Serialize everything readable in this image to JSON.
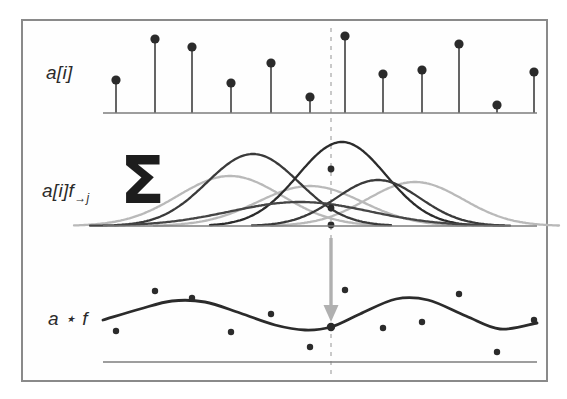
{
  "figure": {
    "background": "#ffffff",
    "frame": {
      "stroke": "#8a8a8a",
      "x": 21,
      "y": 19,
      "width": 527,
      "height": 363
    }
  },
  "colors": {
    "dark": "#2b2b2b",
    "mid": "#4a4a4a",
    "light_gray": "#b9b9b9",
    "axis": "#7d7d7d",
    "dashed": "#c9c9c9",
    "arrow": "#b0b0b0",
    "frame": "#8a8a8a"
  },
  "labels": {
    "top_panel": "a[i]",
    "middle_panel_main": "a[i]f",
    "middle_panel_sub": "→j",
    "bottom_panel": "a ⋆ f",
    "sigma": "Σ"
  },
  "marker_line": {
    "name": "alignment-dashed-line",
    "x": 331,
    "y_top": 28,
    "y_bottom": 375,
    "dash": "4 5"
  },
  "arrow": {
    "name": "down-arrow",
    "x": 331,
    "y_start": 238,
    "y_end": 322,
    "color": "#b0b0b0"
  },
  "chart_data": {
    "type": "line",
    "xlabel": "",
    "ylabel": "",
    "panels": [
      {
        "id": "input-signal",
        "label": "a[i]",
        "type": "stem",
        "baseline_y": 113,
        "x_start": 103,
        "x_end": 537,
        "stems": [
          {
            "x": 116,
            "y": 80,
            "value": 0.45
          },
          {
            "x": 155,
            "y": 39,
            "value": 0.92
          },
          {
            "x": 192,
            "y": 47,
            "value": 0.84
          },
          {
            "x": 231,
            "y": 83,
            "value": 0.41
          },
          {
            "x": 271,
            "y": 63,
            "value": 0.63
          },
          {
            "x": 310,
            "y": 97,
            "value": 0.26
          },
          {
            "x": 345,
            "y": 36,
            "value": 0.95
          },
          {
            "x": 383,
            "y": 74,
            "value": 0.52
          },
          {
            "x": 422,
            "y": 70,
            "value": 0.57
          },
          {
            "x": 459,
            "y": 44,
            "value": 0.87
          },
          {
            "x": 497,
            "y": 105,
            "value": 0.16
          },
          {
            "x": 534,
            "y": 72,
            "value": 0.54
          }
        ]
      },
      {
        "id": "shifted-filter-responses",
        "label": "a[i]f→j",
        "type": "gaussians",
        "baseline_y": 226,
        "x_start": 103,
        "x_end": 537,
        "curves": [
          {
            "center": 230,
            "height": 50,
            "width": 52,
            "shade": "#b9b9b9",
            "name": "gaussian-light-1"
          },
          {
            "center": 310,
            "height": 40,
            "width": 52,
            "shade": "#b9b9b9",
            "name": "gaussian-light-2"
          },
          {
            "center": 415,
            "height": 44,
            "width": 48,
            "shade": "#b9b9b9",
            "name": "gaussian-light-3"
          },
          {
            "center": 253,
            "height": 72,
            "width": 46,
            "shade": "#3a3a3a",
            "name": "gaussian-dark-1"
          },
          {
            "center": 342,
            "height": 84,
            "width": 44,
            "shade": "#2b2b2b",
            "name": "gaussian-dark-2"
          },
          {
            "center": 378,
            "height": 46,
            "width": 42,
            "shade": "#3a3a3a",
            "name": "gaussian-dark-3"
          },
          {
            "center": 300,
            "height": 24,
            "width": 70,
            "shade": "#454545",
            "name": "gaussian-dark-4"
          }
        ],
        "intersection_dots": [
          {
            "x": 331,
            "y": 169,
            "name": "peak-contribution-dot"
          },
          {
            "x": 331,
            "y": 208,
            "name": "mid-contribution-dot"
          },
          {
            "x": 331,
            "y": 225,
            "name": "base-contribution-dot"
          }
        ]
      },
      {
        "id": "convolution-output",
        "label": "a ⋆ f",
        "type": "curve-with-points",
        "baseline_y": 362,
        "x_start": 103,
        "x_end": 537,
        "curve_points": [
          {
            "x": 103,
            "y": 320
          },
          {
            "x": 140,
            "y": 309
          },
          {
            "x": 172,
            "y": 301
          },
          {
            "x": 205,
            "y": 302
          },
          {
            "x": 240,
            "y": 313
          },
          {
            "x": 275,
            "y": 325
          },
          {
            "x": 305,
            "y": 330
          },
          {
            "x": 331,
            "y": 327
          },
          {
            "x": 360,
            "y": 314
          },
          {
            "x": 396,
            "y": 299
          },
          {
            "x": 428,
            "y": 300
          },
          {
            "x": 466,
            "y": 316
          },
          {
            "x": 500,
            "y": 329
          },
          {
            "x": 537,
            "y": 323
          }
        ],
        "scatter_points": [
          {
            "x": 116,
            "y": 331
          },
          {
            "x": 155,
            "y": 291
          },
          {
            "x": 192,
            "y": 298
          },
          {
            "x": 231,
            "y": 332
          },
          {
            "x": 271,
            "y": 314
          },
          {
            "x": 310,
            "y": 347
          },
          {
            "x": 331,
            "y": 327,
            "highlight": true
          },
          {
            "x": 345,
            "y": 290
          },
          {
            "x": 383,
            "y": 328
          },
          {
            "x": 422,
            "y": 322
          },
          {
            "x": 459,
            "y": 294
          },
          {
            "x": 497,
            "y": 352
          },
          {
            "x": 534,
            "y": 320
          }
        ]
      }
    ]
  }
}
